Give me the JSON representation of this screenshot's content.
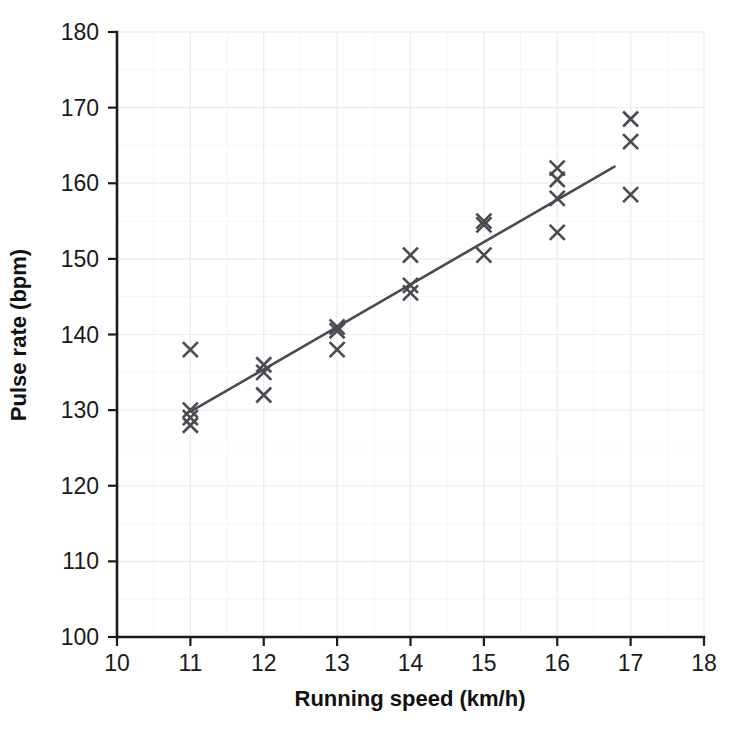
{
  "chart_data": {
    "type": "scatter",
    "title": "",
    "xlabel": "Running speed (km/h)",
    "ylabel": "Pulse rate (bpm)",
    "xlim": [
      10,
      18
    ],
    "ylim": [
      100,
      180
    ],
    "xticks": [
      10,
      11,
      12,
      13,
      14,
      15,
      16,
      17,
      18
    ],
    "yticks": [
      100,
      110,
      120,
      130,
      140,
      150,
      160,
      170,
      180
    ],
    "xtick_labels": [
      "10",
      "11",
      "12",
      "13",
      "14",
      "15",
      "16",
      "17",
      "18"
    ],
    "ytick_labels": [
      "100",
      "110",
      "120",
      "130",
      "140",
      "150",
      "160",
      "170",
      "180"
    ],
    "grid": true,
    "grid_major_step_x": 1,
    "grid_major_step_y": 10,
    "grid_minor_step_x": 0.5,
    "grid_minor_step_y": 5,
    "legend": null,
    "marker_symbol": "x",
    "marker_color": "#4a4a52",
    "series": [
      {
        "name": "Pulse rate vs running speed",
        "marker": "x",
        "points": [
          {
            "x": 11,
            "y": 138
          },
          {
            "x": 11,
            "y": 130
          },
          {
            "x": 11,
            "y": 129
          },
          {
            "x": 11,
            "y": 128
          },
          {
            "x": 12,
            "y": 136
          },
          {
            "x": 12,
            "y": 135
          },
          {
            "x": 12,
            "y": 132
          },
          {
            "x": 13,
            "y": 141
          },
          {
            "x": 13,
            "y": 140.5
          },
          {
            "x": 13,
            "y": 138
          },
          {
            "x": 14,
            "y": 150.5
          },
          {
            "x": 14,
            "y": 146.5
          },
          {
            "x": 14,
            "y": 145.5
          },
          {
            "x": 15,
            "y": 155
          },
          {
            "x": 15,
            "y": 154.5
          },
          {
            "x": 15,
            "y": 150.5
          },
          {
            "x": 16,
            "y": 162
          },
          {
            "x": 16,
            "y": 160.5
          },
          {
            "x": 16,
            "y": 158
          },
          {
            "x": 16,
            "y": 153.5
          },
          {
            "x": 17,
            "y": 168.5
          },
          {
            "x": 17,
            "y": 165.5
          },
          {
            "x": 17,
            "y": 158.5
          }
        ]
      }
    ],
    "trendline": {
      "name": "line of best fit",
      "color": "#4a4a52",
      "x_start": 11,
      "y_start": 129.8,
      "x_end": 16.78,
      "y_end": 162.2
    }
  }
}
